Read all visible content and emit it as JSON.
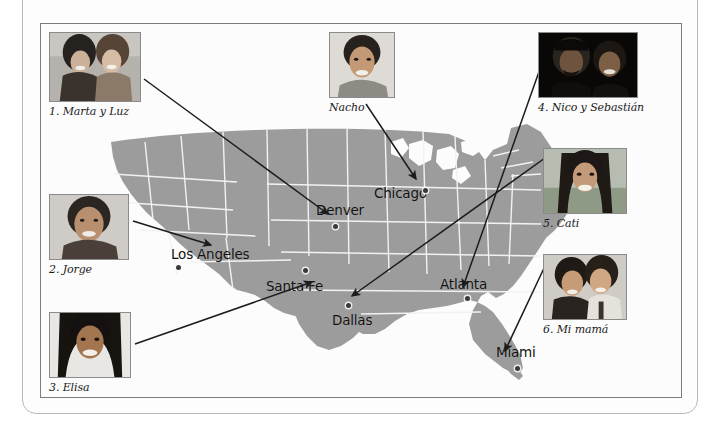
{
  "figure": {
    "map_fill_color": "#9c9c9c",
    "border_color": "#f2f2f2",
    "label_color": "#111111",
    "background_color": "#ffffff"
  },
  "cities": [
    {
      "name": "Denver",
      "label_x": 275,
      "label_y": 178,
      "dot_x": 292,
      "dot_y": 200
    },
    {
      "name": "Chicago",
      "label_x": 333,
      "label_y": 161,
      "dot_x": 382,
      "dot_y": 164
    },
    {
      "name": "Los Angeles",
      "label_x": 130,
      "label_y": 222,
      "dot_x": 135,
      "dot_y": 241
    },
    {
      "name": "Santa Fe",
      "label_x": 225,
      "label_y": 254,
      "dot_x": 262,
      "dot_y": 244
    },
    {
      "name": "Dallas",
      "label_x": 291,
      "label_y": 288,
      "dot_x": 305,
      "dot_y": 279
    },
    {
      "name": "Atlanta",
      "label_x": 399,
      "label_y": 252,
      "dot_x": 424,
      "dot_y": 272
    },
    {
      "name": "Miami",
      "label_x": 455,
      "label_y": 320,
      "dot_x": 474,
      "dot_y": 342
    }
  ],
  "callouts": [
    {
      "id": "marta-y-luz",
      "caption": "1. Marta y Luz",
      "photo_alt": "two smiling young women",
      "x": 8,
      "y": 8,
      "w": 92,
      "h": 70,
      "line": {
        "x1": 103,
        "y1": 55,
        "x2": 287,
        "y2": 190
      }
    },
    {
      "id": "jorge",
      "caption": "2. Jorge",
      "photo_alt": "smiling young man",
      "x": 8,
      "y": 170,
      "w": 80,
      "h": 66,
      "line": {
        "x1": 92,
        "y1": 197,
        "x2": 170,
        "y2": 221
      }
    },
    {
      "id": "elisa",
      "caption": "3. Elisa",
      "photo_alt": "smiling young woman with dark hair",
      "x": 8,
      "y": 288,
      "w": 82,
      "h": 66,
      "line": {
        "x1": 94,
        "y1": 320,
        "x2": 271,
        "y2": 258
      }
    },
    {
      "id": "nico-y-sebastian",
      "caption": "4. Nico y Sebastián",
      "photo_alt": "two men at night",
      "x": 497,
      "y": 8,
      "w": 100,
      "h": 66,
      "line": {
        "x1": 500,
        "y1": 42,
        "x2": 422,
        "y2": 263
      }
    },
    {
      "id": "cati",
      "caption": "5. Cati",
      "photo_alt": "smiling woman outdoors",
      "x": 502,
      "y": 124,
      "w": 84,
      "h": 66,
      "line": {
        "x1": 504,
        "y1": 134,
        "x2": 311,
        "y2": 272
      }
    },
    {
      "id": "mi-mama",
      "caption": "6. Mi mamá",
      "photo_alt": "two women smiling together",
      "x": 502,
      "y": 230,
      "w": 84,
      "h": 66,
      "line": {
        "x1": 504,
        "y1": 242,
        "x2": 464,
        "y2": 327
      }
    },
    {
      "id": "nacho",
      "caption": "Nacho",
      "photo_alt": "smiling young man",
      "x": 288,
      "y": 8,
      "w": 66,
      "h": 66,
      "line": {
        "x1": 325,
        "y1": 80,
        "x2": 375,
        "y2": 155
      }
    }
  ]
}
